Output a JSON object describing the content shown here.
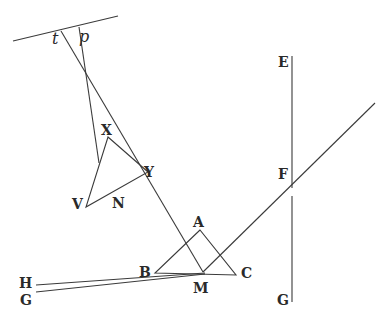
{
  "diagram": {
    "labels": {
      "t": "t",
      "p": "p",
      "X": "X",
      "Y": "Y",
      "V": "V",
      "N": "N",
      "A": "A",
      "B": "B",
      "C": "C",
      "M": "M",
      "H": "H",
      "G_left": "G",
      "E": "E",
      "F": "F",
      "G_right": "G"
    },
    "colors": {
      "line": "#3a3a3a",
      "text": "#2a2a2a",
      "background": "#ffffff"
    }
  }
}
